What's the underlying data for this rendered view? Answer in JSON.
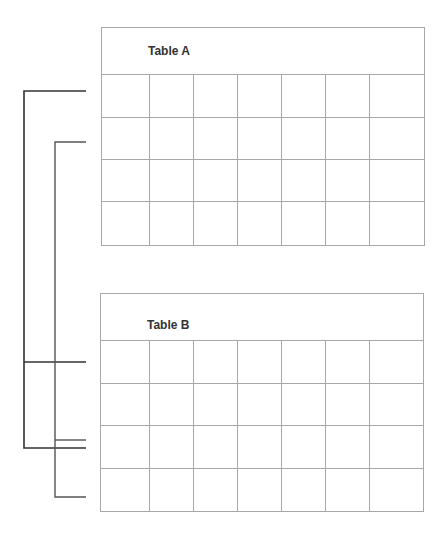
{
  "tables": [
    {
      "title": "Table A",
      "columns": 7,
      "rows": 4
    },
    {
      "title": "Table B",
      "columns": 7,
      "rows": 4
    }
  ],
  "colors": {
    "grid": "#a8a8a8",
    "connector": "#333333",
    "title": "#333333"
  }
}
